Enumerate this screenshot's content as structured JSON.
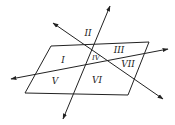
{
  "diagram": {
    "stroke_color": "#222222",
    "background": "#ffffff",
    "plane": {
      "points": [
        [
          51,
          46
        ],
        [
          149,
          42
        ],
        [
          128,
          95
        ],
        [
          25,
          93
        ]
      ]
    },
    "lines": [
      {
        "name": "steep-line",
        "from": [
          63,
          119
        ],
        "to": [
          110,
          6
        ]
      },
      {
        "name": "diagonal-line",
        "from": [
          53,
          23
        ],
        "to": [
          163,
          99
        ]
      },
      {
        "name": "shallow-line",
        "from": [
          11,
          79
        ],
        "to": [
          168,
          49
        ]
      }
    ],
    "regions": [
      {
        "id": "I",
        "label": "I",
        "x": 63,
        "y": 60
      },
      {
        "id": "II",
        "label": "II",
        "x": 88,
        "y": 33
      },
      {
        "id": "III",
        "label": "III",
        "x": 119,
        "y": 50
      },
      {
        "id": "IV",
        "label": "IV",
        "x": 96,
        "y": 58,
        "small": true
      },
      {
        "id": "V",
        "label": "V",
        "x": 55,
        "y": 81
      },
      {
        "id": "VI",
        "label": "VI",
        "x": 97,
        "y": 80
      },
      {
        "id": "VII",
        "label": "VII",
        "x": 128,
        "y": 64
      }
    ]
  }
}
